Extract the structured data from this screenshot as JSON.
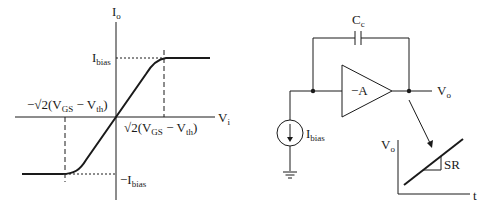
{
  "transfer_plot": {
    "y_axis_label": "I",
    "y_axis_sub": "o",
    "x_axis_label": "V",
    "x_axis_sub": "i",
    "pos_level_label": "I",
    "pos_level_sub": "bias",
    "neg_level_prefix": "−I",
    "neg_level_sub": "bias",
    "pos_knee_label": {
      "prefix": "√2(V",
      "sub1": "GS",
      "mid": " − V",
      "sub2": "th",
      "suffix": ")"
    },
    "neg_knee_label": {
      "prefix": "−√2(V",
      "sub1": "GS",
      "mid": " − V",
      "sub2": "th",
      "suffix": ")"
    }
  },
  "circuit": {
    "capacitor_label": "C",
    "capacitor_sub": "c",
    "amplifier_label": "−A",
    "output_label": "V",
    "output_sub": "o",
    "source_label": "I",
    "source_sub": "bias"
  },
  "slew_plot": {
    "y_axis_label": "V",
    "y_axis_sub": "o",
    "x_axis_label": "t",
    "slope_label": "SR"
  },
  "colors": {
    "stroke": "#1a1a1a",
    "background": "#ffffff"
  }
}
